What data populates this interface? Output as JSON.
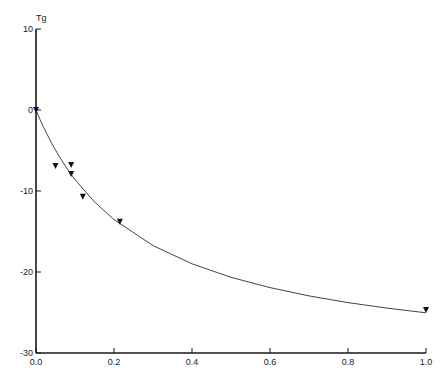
{
  "chart_data": {
    "type": "scatter",
    "title": "",
    "xlabel": "",
    "ylabel": "Tg",
    "xlim": [
      0.0,
      1.0
    ],
    "ylim": [
      -30,
      10
    ],
    "grid": false,
    "legend": null,
    "x_ticks": [
      "0.0",
      "0.2",
      "0.4",
      "0.6",
      "0.8",
      "1.0"
    ],
    "x_tick_values": [
      0.0,
      0.2,
      0.4,
      0.6,
      0.8,
      1.0
    ],
    "y_ticks": [
      "10",
      "0",
      "-10",
      "-20",
      "-30"
    ],
    "y_tick_values": [
      10,
      0,
      -10,
      -20,
      -30
    ],
    "series": [
      {
        "name": "measured",
        "marker": "triangle-down",
        "x": [
          0.0,
          0.05,
          0.09,
          0.09,
          0.12,
          0.215,
          1.0
        ],
        "y": [
          0.0,
          -6.9,
          -6.8,
          -7.9,
          -10.7,
          -13.8,
          -24.7
        ]
      },
      {
        "name": "fitted curve",
        "style": "line",
        "x": [
          0.0,
          0.01,
          0.02,
          0.04,
          0.06,
          0.08,
          0.1,
          0.15,
          0.2,
          0.3,
          0.4,
          0.5,
          0.6,
          0.7,
          0.8,
          0.9,
          1.0
        ],
        "y": [
          0.0,
          -1.14,
          -2.19,
          -4.1,
          -5.78,
          -7.27,
          -8.59,
          -11.36,
          -13.53,
          -16.74,
          -18.99,
          -20.65,
          -21.93,
          -22.95,
          -23.78,
          -24.46,
          -25.04
        ]
      }
    ]
  },
  "layout": {
    "plot_left_px": 36,
    "plot_right_px": 426,
    "y_zero_px": 110,
    "px_per_y_unit": 8.1,
    "colors": {
      "axis": "#1a1a1a",
      "curve": "#444444",
      "marker": "#111111"
    }
  }
}
